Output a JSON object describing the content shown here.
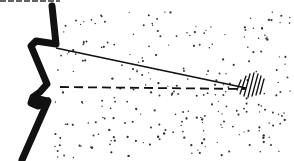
{
  "figure": {
    "type": "line-drawing",
    "colors": {
      "ink": "#111111",
      "background": "#ffffff",
      "stipple": "#333333"
    },
    "elements": {
      "boundary": {
        "label": ""
      },
      "solid_line": {
        "label": "",
        "from": [
          42,
          58
        ],
        "to": [
          244,
          88
        ]
      },
      "dashed_line": {
        "label": "",
        "from": [
          58,
          87
        ],
        "to": [
          244,
          89
        ]
      },
      "hatched_spot": {
        "label": "",
        "center": [
          252,
          85
        ]
      }
    },
    "top_text_fragment": ""
  }
}
